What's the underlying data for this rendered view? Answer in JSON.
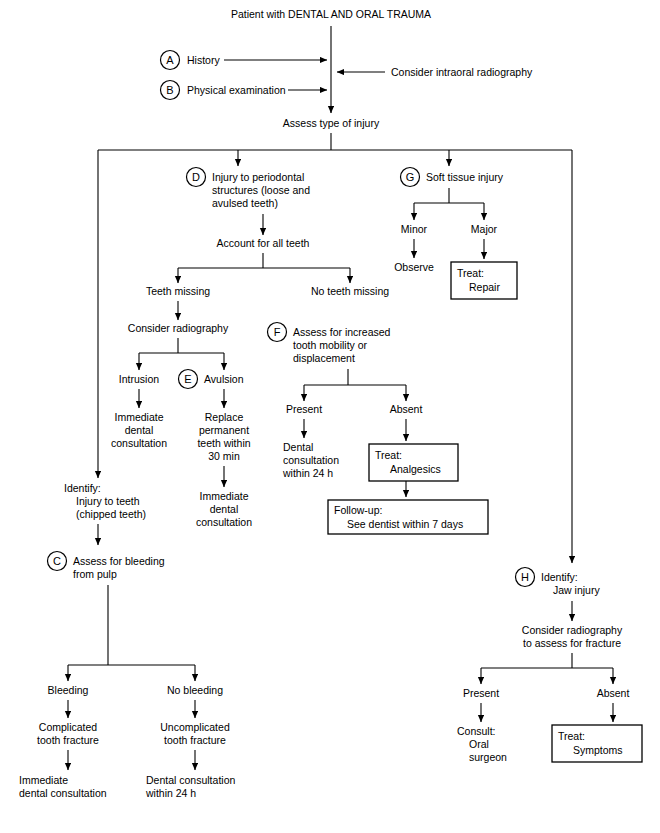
{
  "figure": {
    "type": "clinical-algorithm-flowchart",
    "title": "Patient with DENTAL AND ORAL TRAUMA",
    "line_color": "#000000",
    "background_color": "#ffffff"
  },
  "nodes": {
    "root": "Patient with DENTAL AND ORAL TRAUMA",
    "history": "History",
    "physical_exam": "Physical examination",
    "radiography_note": "Consider intraoral radiography",
    "assess_type": "Assess type of injury",
    "periodontal_l1": "Injury to periodontal",
    "periodontal_l2": "structures (loose and",
    "periodontal_l3": "avulsed teeth)",
    "account_teeth": "Account for all teeth",
    "teeth_missing": "Teeth missing",
    "no_teeth_missing": "No teeth missing",
    "consider_radiography": "Consider radiography",
    "intrusion": "Intrusion",
    "avulsion": "Avulsion",
    "immediate_dental_1": "Immediate",
    "immediate_dental_2": "dental",
    "immediate_dental_3": "consultation",
    "replace_1": "Replace",
    "replace_2": "permanent",
    "replace_3": "teeth within",
    "replace_4": "30 min",
    "imm_dental_b1": "Immediate",
    "imm_dental_b2": "dental",
    "imm_dental_b3": "consultation",
    "identify_teeth_1": "Identify:",
    "identify_teeth_2": "Injury to teeth",
    "identify_teeth_3": "(chipped teeth)",
    "assess_bleeding_1": "Assess for bleeding",
    "assess_bleeding_2": "from pulp",
    "bleeding": "Bleeding",
    "no_bleeding": "No bleeding",
    "complicated_1": "Complicated",
    "complicated_2": "tooth fracture",
    "uncomplicated_1": "Uncomplicated",
    "uncomplicated_2": "tooth fracture",
    "imm_dental_c1": "Immediate",
    "imm_dental_c2": "dental consultation",
    "dental_cons_24h_1": "Dental consultation",
    "dental_cons_24h_2": "within 24 h",
    "assess_mobility_1": "Assess for increased",
    "assess_mobility_2": "tooth mobility or",
    "assess_mobility_3": "displacement",
    "present_f": "Present",
    "absent_f": "Absent",
    "dental_cons_f1": "Dental",
    "dental_cons_f2": "consultation",
    "dental_cons_f3": "within 24 h",
    "treat_analgesics_1": "Treat:",
    "treat_analgesics_2": "Analgesics",
    "followup_1": "Follow-up:",
    "followup_2": "See dentist within 7 days",
    "soft_tissue": "Soft tissue injury",
    "minor": "Minor",
    "major": "Major",
    "observe": "Observe",
    "treat_repair_1": "Treat:",
    "treat_repair_2": "Repair",
    "identify_jaw_1": "Identify:",
    "identify_jaw_2": "Jaw injury",
    "consider_rad_jaw_1": "Consider radiography",
    "consider_rad_jaw_2": "to assess for fracture",
    "present_h": "Present",
    "absent_h": "Absent",
    "consult_1": "Consult:",
    "consult_2": "Oral",
    "consult_3": "surgeon",
    "treat_symptoms_1": "Treat:",
    "treat_symptoms_2": "Symptoms"
  },
  "key_letters": {
    "a": "A",
    "b": "B",
    "c": "C",
    "d": "D",
    "e": "E",
    "f": "F",
    "g": "G",
    "h": "H"
  },
  "boxed_nodes": [
    "Treat: Repair",
    "Treat: Analgesics",
    "Follow-up: See dentist within 7 days",
    "Treat: Symptoms"
  ]
}
